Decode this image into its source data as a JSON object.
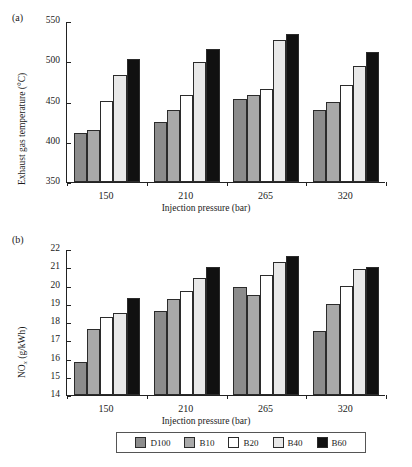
{
  "figure": {
    "legend": {
      "entries": [
        {
          "label": "D100",
          "color": "#8c8c8c"
        },
        {
          "label": "B10",
          "color": "#a9a9a9"
        },
        {
          "label": "B20",
          "color": "#ffffff"
        },
        {
          "label": "B40",
          "color": "#e8e8e8"
        },
        {
          "label": "B60",
          "color": "#111111"
        }
      ]
    }
  },
  "chart_data": [
    {
      "type": "bar",
      "panel_label": "(a)",
      "title": "",
      "xlabel": "Injection pressure (bar)",
      "ylabel": "Exhaust gas temperature (°C)",
      "categories": [
        "150",
        "210",
        "265",
        "320"
      ],
      "ylim": [
        350,
        550
      ],
      "yticks": [
        350,
        400,
        450,
        500,
        550
      ],
      "grid": false,
      "legend_position": "bottom",
      "series": [
        {
          "name": "D100",
          "color": "#8c8c8c",
          "values": [
            411,
            425,
            453,
            439
          ]
        },
        {
          "name": "B10",
          "color": "#a9a9a9",
          "values": [
            415,
            440,
            458,
            450
          ]
        },
        {
          "name": "B20",
          "color": "#ffffff",
          "values": [
            451,
            458,
            466,
            470
          ]
        },
        {
          "name": "B40",
          "color": "#e8e8e8",
          "values": [
            483,
            499,
            527,
            494
          ]
        },
        {
          "name": "B60",
          "color": "#111111",
          "values": [
            503,
            515,
            534,
            512
          ]
        }
      ]
    },
    {
      "type": "bar",
      "panel_label": "(b)",
      "title": "",
      "xlabel": "Injection pressure (bar)",
      "ylabel": "NOx (g/kWh)",
      "categories": [
        "150",
        "210",
        "265",
        "320"
      ],
      "ylim": [
        14,
        22
      ],
      "yticks": [
        14,
        15,
        16,
        17,
        18,
        19,
        20,
        21,
        22
      ],
      "grid": false,
      "legend_position": "bottom",
      "series": [
        {
          "name": "D100",
          "color": "#8c8c8c",
          "values": [
            15.8,
            18.6,
            19.9,
            17.5
          ]
        },
        {
          "name": "B10",
          "color": "#a9a9a9",
          "values": [
            17.6,
            19.25,
            19.5,
            19.0
          ]
        },
        {
          "name": "B20",
          "color": "#ffffff",
          "values": [
            18.3,
            19.7,
            20.6,
            20.0
          ]
        },
        {
          "name": "B40",
          "color": "#e8e8e8",
          "values": [
            18.5,
            20.4,
            21.3,
            20.9
          ]
        },
        {
          "name": "B60",
          "color": "#111111",
          "values": [
            19.3,
            21.0,
            21.6,
            21.0
          ]
        }
      ]
    }
  ]
}
